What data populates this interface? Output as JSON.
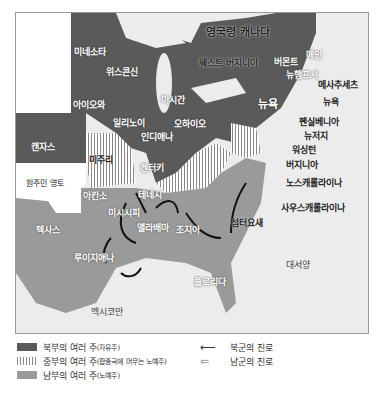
{
  "map": {
    "regions": {
      "canada": "영국령 캐나다",
      "native": "원주민 영토",
      "gulf": "멕시코만",
      "atlantic": "대서양"
    },
    "states": {
      "minnesota": "미네소타",
      "wisconsin": "위스콘신",
      "michigan": "미시간",
      "iowa": "아이오와",
      "illinois": "일리노이",
      "indiana": "인디애나",
      "ohio": "오하이오",
      "kansas": "캔자스",
      "missouri": "미주리",
      "kentucky": "켄터키",
      "arkansas": "아칸소",
      "tennessee": "테네시",
      "mississippi": "미시시피",
      "alabama": "앨라배마",
      "georgia": "조지아",
      "texas": "텍사스",
      "louisiana": "루이지애나",
      "florida": "플로리다",
      "westvirginia": "웨스트 버지니아",
      "newyork": "뉴욕",
      "maine": "메인",
      "vermont": "버몬트",
      "newhampshire": "뉴햄프셔",
      "massachusetts": "메사추세츠",
      "newyork_city": "뉴욕",
      "pennsylvania": "펜실베니아",
      "newjersey": "뉴저지",
      "washington": "워싱턴",
      "virginia": "버지니아",
      "northcarolina": "노스캐롤라이나",
      "southcarolina": "사우스캐롤라이나",
      "sumter": "섬터요새"
    }
  },
  "legend": {
    "north": "북부의 여러 주",
    "north_sub": "(자유주)",
    "mid": "중부의 여러 주",
    "mid_sub": "(합중국에 머무는 노예주)",
    "south": "남부의 여러 주",
    "south_sub": "(노예주)",
    "union_route": "북군의 진로",
    "confed_route": "남군의 진로"
  },
  "colors": {
    "north": "#5a5a5a",
    "south": "#9a9a9a",
    "water": "#ececec"
  }
}
